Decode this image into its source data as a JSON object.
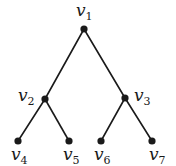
{
  "diagram": {
    "type": "binary-tree",
    "nodes": [
      {
        "id": "v1",
        "base": "v",
        "sub": "1",
        "x": 84,
        "y": 29,
        "lx": 76,
        "ly": 16
      },
      {
        "id": "v2",
        "base": "v",
        "sub": "2",
        "x": 45,
        "y": 99,
        "lx": 18,
        "ly": 101
      },
      {
        "id": "v3",
        "base": "v",
        "sub": "3",
        "x": 125,
        "y": 98,
        "lx": 134,
        "ly": 101
      },
      {
        "id": "v4",
        "base": "v",
        "sub": "4",
        "x": 18,
        "y": 141,
        "lx": 11,
        "ly": 160
      },
      {
        "id": "v5",
        "base": "v",
        "sub": "5",
        "x": 69,
        "y": 141,
        "lx": 63,
        "ly": 160
      },
      {
        "id": "v6",
        "base": "v",
        "sub": "6",
        "x": 101,
        "y": 141,
        "lx": 94,
        "ly": 160
      },
      {
        "id": "v7",
        "base": "v",
        "sub": "7",
        "x": 152,
        "y": 141,
        "lx": 149,
        "ly": 160
      }
    ],
    "edges": [
      {
        "from": "v1",
        "to": "v2"
      },
      {
        "from": "v1",
        "to": "v3"
      },
      {
        "from": "v2",
        "to": "v4"
      },
      {
        "from": "v2",
        "to": "v5"
      },
      {
        "from": "v3",
        "to": "v6"
      },
      {
        "from": "v3",
        "to": "v7"
      }
    ],
    "colors": {
      "ink": "#1a1a1a",
      "background": "#ffffff"
    }
  }
}
